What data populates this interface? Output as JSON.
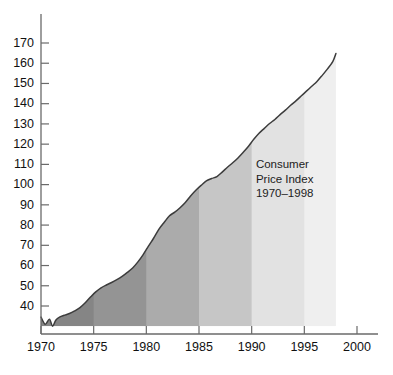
{
  "chart_data": {
    "type": "area",
    "xlabel": "",
    "ylabel": "",
    "xlim": [
      1970,
      2000
    ],
    "ylim": [
      30,
      175
    ],
    "grid": false,
    "legend": null,
    "annotations": [
      {
        "name": "series-annotation",
        "lines": [
          "Consumer",
          "Price Index",
          "1970–1998"
        ],
        "x": 1990.4,
        "y": 108
      }
    ],
    "y_ticks": [
      40,
      50,
      60,
      70,
      80,
      90,
      100,
      110,
      120,
      130,
      140,
      150,
      160,
      170
    ],
    "y_tick_labels": [
      "40",
      "50",
      "60",
      "70",
      "80",
      "90",
      "100",
      "110",
      "120",
      "130",
      "140",
      "150",
      "160",
      "170"
    ],
    "x_ticks": [
      1970,
      1975,
      1980,
      1985,
      1990,
      1995,
      2000
    ],
    "x_tick_labels": [
      "1970",
      "1975",
      "1980",
      "1985",
      "1990",
      "1995",
      "2000"
    ],
    "bands": [
      {
        "label": "1970–1975",
        "x0": 1970,
        "x1": 1975,
        "color": "#858585"
      },
      {
        "label": "1975–1980",
        "x0": 1975,
        "x1": 1980,
        "color": "#949494"
      },
      {
        "label": "1980–1985",
        "x0": 1980,
        "x1": 1985,
        "color": "#ababab"
      },
      {
        "label": "1985–1990",
        "x0": 1985,
        "x1": 1990,
        "color": "#c6c6c6"
      },
      {
        "label": "1990–1995",
        "x0": 1990,
        "x1": 1995,
        "color": "#e2e2e2"
      },
      {
        "label": "1995–1998",
        "x0": 1995,
        "x1": 1998,
        "color": "#efefef"
      }
    ],
    "series": [
      {
        "name": "Consumer Price Index",
        "x": [
          1970,
          1970.4,
          1970.8,
          1971.1,
          1971.4,
          1971.8,
          1972.2,
          1972.7,
          1973.2,
          1973.7,
          1974.2,
          1974.7,
          1975.2,
          1975.7,
          1976.2,
          1976.7,
          1977.2,
          1977.7,
          1978.2,
          1978.7,
          1979.2,
          1979.7,
          1980.2,
          1980.7,
          1981.2,
          1981.7,
          1982.2,
          1982.7,
          1983.2,
          1983.7,
          1984.2,
          1984.7,
          1985.2,
          1985.7,
          1986.2,
          1986.7,
          1987.2,
          1987.7,
          1988.2,
          1988.7,
          1989.2,
          1989.7,
          1990.2,
          1990.7,
          1991.2,
          1991.7,
          1992.2,
          1992.7,
          1993.2,
          1993.7,
          1994.2,
          1994.7,
          1995.2,
          1995.7,
          1996.2,
          1996.7,
          1997.2,
          1997.7,
          1998.0
        ],
        "y": [
          34.5,
          31.0,
          33.5,
          30.0,
          33.0,
          34.6,
          35.4,
          36.3,
          37.6,
          39.2,
          41.6,
          44.4,
          47.0,
          49.0,
          50.4,
          51.6,
          53.0,
          54.6,
          56.6,
          58.8,
          61.8,
          65.4,
          69.6,
          73.6,
          78.0,
          81.4,
          84.6,
          86.4,
          88.6,
          91.2,
          94.4,
          97.2,
          99.6,
          101.8,
          103.0,
          104.0,
          106.2,
          108.6,
          110.8,
          113.2,
          116.0,
          119.0,
          122.4,
          125.4,
          127.8,
          130.2,
          132.2,
          134.6,
          136.8,
          139.2,
          141.4,
          143.8,
          146.2,
          148.6,
          151.0,
          154.0,
          157.2,
          160.8,
          164.8
        ]
      }
    ]
  },
  "chart": {
    "series_line_color": "#3c3c3c",
    "axis_color": "#6a6a6a",
    "axis_label_color": "#111111"
  }
}
